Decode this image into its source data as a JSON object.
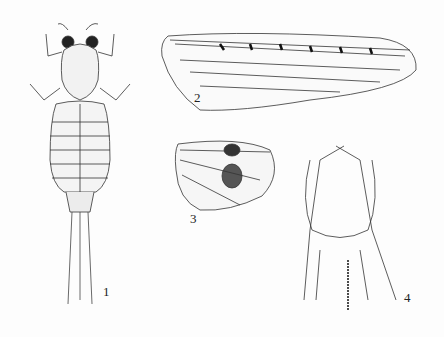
{
  "plate": {
    "figures": [
      {
        "id": 1,
        "label": "1",
        "subject": "mayfly nymph, dorsal view"
      },
      {
        "id": 2,
        "label": "2",
        "subject": "forewing"
      },
      {
        "id": 3,
        "label": "3",
        "subject": "hindwing"
      },
      {
        "id": 4,
        "label": "4",
        "subject": "male genitalia (forceps)"
      }
    ]
  }
}
